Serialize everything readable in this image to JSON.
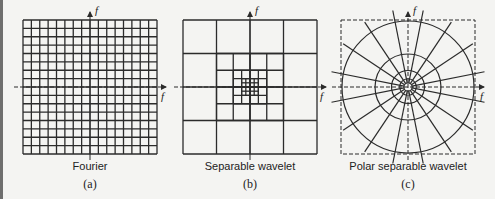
{
  "figure": {
    "panels": [
      {
        "id": "a",
        "label": "(a)",
        "caption": "Fourier",
        "type": "uniform-grid",
        "grid_divisions": 16,
        "axis_labels": {
          "vertical": "f",
          "horizontal": "f"
        }
      },
      {
        "id": "b",
        "label": "(b)",
        "caption": "Separable wavelet",
        "type": "dyadic-tiling",
        "levels": 4,
        "axis_labels": {
          "vertical": "f",
          "horizontal": "f"
        }
      },
      {
        "id": "c",
        "label": "(c)",
        "caption": "Polar separable wavelet",
        "type": "polar-tiling",
        "radial_lines": 16,
        "ring_radii_fraction": [
          1.0,
          0.5,
          0.25,
          0.125,
          0.0625
        ],
        "axis_labels": {
          "vertical": "f",
          "horizontal": "f"
        }
      }
    ],
    "colors": {
      "line": "#2b2b2b",
      "background": "#f4f4f2"
    }
  }
}
